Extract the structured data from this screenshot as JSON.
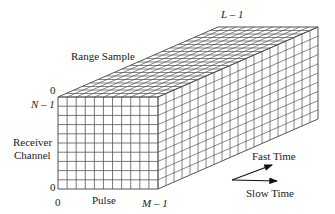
{
  "diagram": {
    "labels": {
      "range_sample": "Range Sample",
      "l_minus_1": "L – 1",
      "n_minus_1": "N – 1",
      "zero_top": "0",
      "receiver_channel_line1": "Receiver",
      "receiver_channel_line2": "Channel",
      "zero_left": "0",
      "zero_bottom": "0",
      "pulse": "Pulse",
      "m_minus_1": "M – 1",
      "fast_time": "Fast Time",
      "slow_time": "Slow Time"
    },
    "cube": {
      "front_origin": [
        58,
        97
      ],
      "front_width": 100,
      "front_height": 92,
      "depth_offset": [
        160,
        -70
      ],
      "columns": 11,
      "rows": 10,
      "depth_cells": 20,
      "line_color": "#555555"
    },
    "arrows": {
      "fast_time": {
        "from": [
          232,
          180
        ],
        "to": [
          272,
          165
        ]
      },
      "slow_time": {
        "from": [
          232,
          180
        ],
        "to": [
          277,
          181
        ]
      }
    }
  }
}
